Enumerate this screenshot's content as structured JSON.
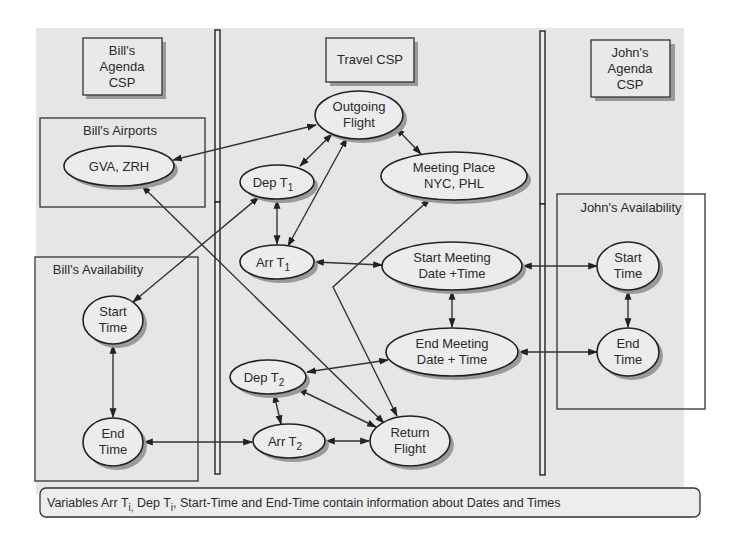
{
  "diagram": {
    "csp_labels": {
      "bill_line1": "Bill's",
      "bill_line2": "Agenda",
      "bill_line3": "CSP",
      "travel": "Travel CSP",
      "john_line1": "John's",
      "john_line2": "Agenda",
      "john_line3": "CSP"
    },
    "groups": {
      "bills_airports": "Bill's Airports",
      "bills_availability": "Bill's Availability",
      "johns_availability": "John's Availability"
    },
    "nodes": {
      "gva_zrh": {
        "line1": "GVA, ZRH"
      },
      "bill_start": {
        "line1": "Start",
        "line2": "Time"
      },
      "bill_end": {
        "line1": "End",
        "line2": "Time"
      },
      "outgoing_flight": {
        "line1": "Outgoing",
        "line2": "Flight"
      },
      "dep_t1": {
        "main": "Dep T",
        "sub": "1"
      },
      "arr_t1": {
        "main": "Arr T",
        "sub": "1"
      },
      "meeting_place": {
        "line1": "Meeting Place",
        "line2": "NYC, PHL"
      },
      "start_meeting": {
        "line1": "Start Meeting",
        "line2": "Date +Time"
      },
      "end_meeting": {
        "line1": "End Meeting",
        "line2": "Date + Time"
      },
      "dep_t2": {
        "main": "Dep T",
        "sub": "2"
      },
      "arr_t2": {
        "main": "Arr T",
        "sub": "2"
      },
      "return_flight": {
        "line1": "Return",
        "line2": "Flight"
      },
      "john_start": {
        "line1": "Start",
        "line2": "Time"
      },
      "john_end": {
        "line1": "End",
        "line2": "Time"
      }
    },
    "edges": [
      {
        "from": "gva_zrh",
        "to": "outgoing_flight",
        "directed": "both"
      },
      {
        "from": "gva_zrh",
        "to": "return_flight",
        "directed": "both"
      },
      {
        "from": "outgoing_flight",
        "to": "dep_t1",
        "directed": "both"
      },
      {
        "from": "outgoing_flight",
        "to": "arr_t1",
        "directed": "both"
      },
      {
        "from": "outgoing_flight",
        "to": "meeting_place",
        "directed": "both"
      },
      {
        "from": "dep_t1",
        "to": "arr_t1",
        "directed": "both"
      },
      {
        "from": "bill_start",
        "to": "dep_t1",
        "directed": "both"
      },
      {
        "from": "arr_t1",
        "to": "start_meeting",
        "directed": "both"
      },
      {
        "from": "meeting_place",
        "to": "return_flight",
        "directed": "both"
      },
      {
        "from": "start_meeting",
        "to": "end_meeting",
        "directed": "both"
      },
      {
        "from": "start_meeting",
        "to": "john_start",
        "directed": "both"
      },
      {
        "from": "end_meeting",
        "to": "john_end",
        "directed": "both"
      },
      {
        "from": "end_meeting",
        "to": "dep_t2",
        "directed": "both"
      },
      {
        "from": "dep_t2",
        "to": "arr_t2",
        "directed": "both"
      },
      {
        "from": "dep_t2",
        "to": "return_flight",
        "directed": "both"
      },
      {
        "from": "arr_t2",
        "to": "return_flight",
        "directed": "both"
      },
      {
        "from": "bill_end",
        "to": "arr_t2",
        "directed": "both"
      },
      {
        "from": "bill_start",
        "to": "bill_end",
        "directed": "both"
      },
      {
        "from": "john_start",
        "to": "john_end",
        "directed": "both"
      }
    ],
    "caption": {
      "part1": "Variables Arr T",
      "sub1": "i,",
      "part2": " Dep T",
      "sub2": "i",
      "part3": ", Start-Time and End-Time contain information about Dates and Times"
    }
  }
}
